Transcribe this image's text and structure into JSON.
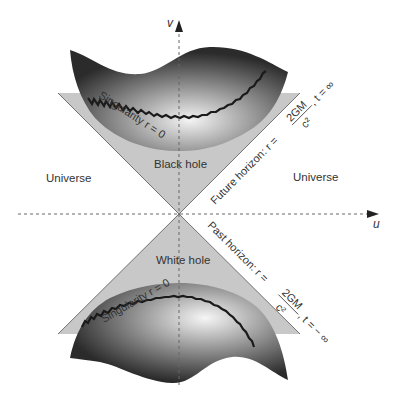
{
  "diagram": {
    "axes": {
      "vertical_label": "v",
      "horizontal_label": "u"
    },
    "regions": {
      "left": "Universe",
      "right": "Universe",
      "top": "Black hole",
      "bottom": "White hole"
    },
    "singularities": {
      "top": "Singularity r = 0",
      "bottom": "Singularity r = 0"
    },
    "horizons": {
      "future": {
        "prefix": "Future horizon: r =",
        "fraction_numerator": "2GM",
        "fraction_denominator": "c²",
        "suffix": ", t = ∞"
      },
      "past": {
        "prefix": "Past horizon: r =",
        "fraction_numerator": "2GM",
        "fraction_denominator": "c²",
        "suffix": ", t = − ∞"
      }
    },
    "colors": {
      "triangle_fill": "#c8c8c8",
      "surface_dark": "#2a2a2a",
      "surface_light": "#f2f2f2",
      "axis_line": "#666666",
      "text": "#333333"
    }
  }
}
